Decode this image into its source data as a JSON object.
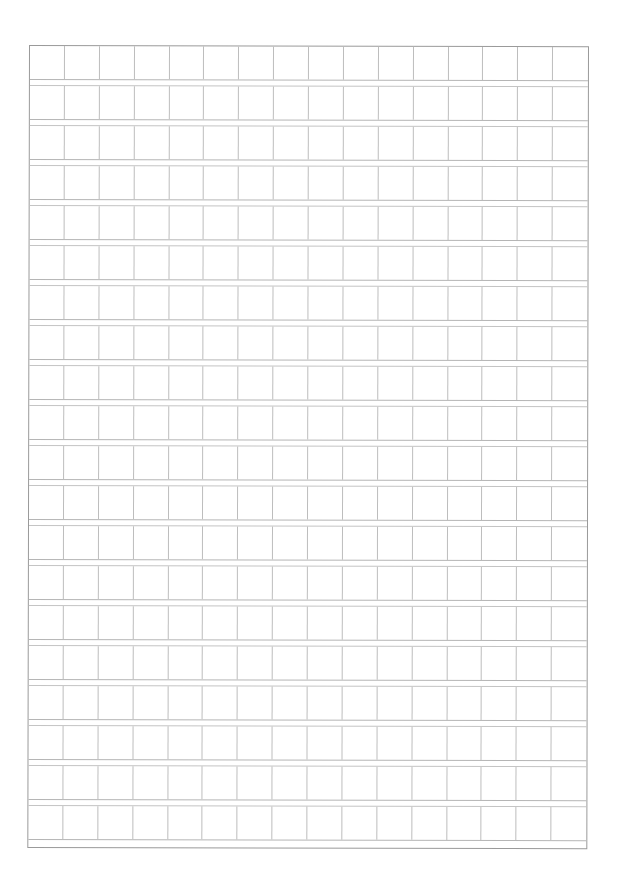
{
  "page": {
    "type": "manuscript-grid-paper",
    "rows": 20,
    "columns": 16,
    "content": []
  },
  "colors": {
    "background": "#ffffff",
    "border": "#9a9a9a",
    "grid_line": "#bdbdbd"
  }
}
